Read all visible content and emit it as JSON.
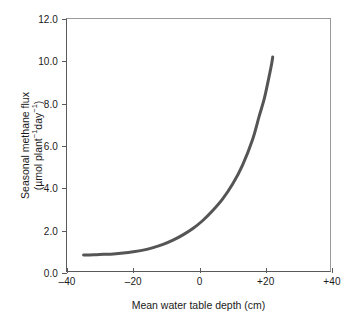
{
  "chart_data": {
    "type": "line",
    "title": "",
    "xlabel": "Mean water table depth (cm)",
    "ylabel_line1": "Seasonal methane flux",
    "ylabel_line2_prefix": "(µmol plant",
    "ylabel_line2_sup1": "−1",
    "ylabel_line2_mid": "day",
    "ylabel_line2_sup2": "−1",
    "ylabel_line2_suffix": ")",
    "ylabel_plain": "Seasonal methane flux (µmol plant⁻¹day⁻¹)",
    "xlim": [
      -40,
      40
    ],
    "ylim": [
      0.0,
      12.0
    ],
    "grid": false,
    "legend": "none",
    "xticks": [
      -40,
      -20,
      0,
      20,
      40
    ],
    "xtick_labels": [
      "–40",
      "–20",
      "0",
      "+20",
      "+40"
    ],
    "yticks": [
      0.0,
      2.0,
      4.0,
      6.0,
      8.0,
      10.0,
      12.0
    ],
    "ytick_labels": [
      "0.0",
      "2.0",
      "4.0",
      "6.0",
      "8.0",
      "10.0",
      "12.0"
    ],
    "series": [
      {
        "name": "Seasonal methane flux vs mean water table depth",
        "color": "#555555",
        "linewidth": 3,
        "x": [
          -35,
          -32,
          -29,
          -26,
          -23,
          -20,
          -17,
          -14,
          -11,
          -8,
          -5,
          -2,
          1,
          4,
          7,
          10,
          13,
          16,
          18,
          19.5,
          20.5,
          21.3,
          21.8,
          22.1
        ],
        "y": [
          0.85,
          0.86,
          0.88,
          0.9,
          0.94,
          1.0,
          1.08,
          1.2,
          1.35,
          1.55,
          1.8,
          2.1,
          2.48,
          2.95,
          3.5,
          4.2,
          5.1,
          6.3,
          7.4,
          8.2,
          8.9,
          9.5,
          9.9,
          10.2
        ]
      }
    ]
  },
  "axes": {
    "x_axis_name": "Mean water table depth (cm)",
    "y_axis_name": "Seasonal methane flux"
  },
  "colors": {
    "curve": "#555555",
    "axis": "#5a5a5a",
    "frame_light": "#9a9a9a",
    "text": "#1a1a1a",
    "background": "#ffffff"
  }
}
